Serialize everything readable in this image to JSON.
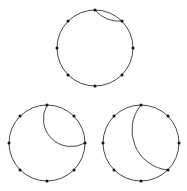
{
  "figure": {
    "background_color": "#ffffff",
    "stroke_color": "#1a1a1a",
    "vertex_color": "#111111",
    "vertex_radius": 1.5,
    "stroke_width": 0.8
  },
  "chart_data": {
    "type": "diagram",
    "title": "",
    "xlabel": "",
    "ylabel": "",
    "grid": false,
    "legend": false,
    "canvas": {
      "width": 187,
      "height": 191
    },
    "shapes": [
      {
        "name": "top-circle",
        "kind": "cycle-graph",
        "center": [
          95,
          48
        ],
        "radius": 38,
        "vertex_count": 8,
        "vertex_start_angle_deg": -90,
        "vertices": [
          [
            95,
            10
          ],
          [
            122,
            21
          ],
          [
            133,
            48
          ],
          [
            122,
            75
          ],
          [
            95,
            86
          ],
          [
            68,
            75
          ],
          [
            57,
            48
          ],
          [
            68,
            21
          ]
        ],
        "chord": {
          "from_vertex_index": 0,
          "to_vertex_index": 1,
          "from_point": [
            95,
            10
          ],
          "to_point": [
            122,
            21
          ],
          "bulge": 0.12,
          "sweep": "outward-shallow"
        }
      },
      {
        "name": "bottom-left-circle",
        "kind": "cycle-graph",
        "center": [
          47,
          143
        ],
        "radius": 38,
        "vertex_count": 8,
        "vertex_start_angle_deg": -90,
        "vertices": [
          [
            47,
            105
          ],
          [
            74,
            116
          ],
          [
            85,
            143
          ],
          [
            74,
            170
          ],
          [
            47,
            181
          ],
          [
            20,
            170
          ],
          [
            9,
            143
          ],
          [
            20,
            116
          ]
        ],
        "chord": {
          "from_vertex_index": 0,
          "to_vertex_index": 2,
          "from_point": [
            47,
            105
          ],
          "to_point": [
            85,
            143
          ],
          "bulge": 0.38,
          "sweep": "outward-right"
        }
      },
      {
        "name": "bottom-right-circle",
        "kind": "cycle-graph",
        "center": [
          141,
          143
        ],
        "radius": 38,
        "vertex_count": 8,
        "vertex_start_angle_deg": -90,
        "vertices": [
          [
            141,
            105
          ],
          [
            168,
            116
          ],
          [
            179,
            143
          ],
          [
            168,
            170
          ],
          [
            141,
            181
          ],
          [
            114,
            170
          ],
          [
            103,
            143
          ],
          [
            114,
            116
          ]
        ],
        "chord": {
          "from_vertex_index": 0,
          "to_vertex_index": 3,
          "from_point": [
            141,
            105
          ],
          "to_point": [
            168,
            170
          ],
          "bulge": 0.3,
          "sweep": "outward-right"
        }
      }
    ]
  }
}
